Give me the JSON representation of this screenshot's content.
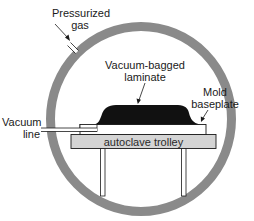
{
  "diagram": {
    "type": "autoclave-cross-section",
    "labels": {
      "pressurized_gas_line1": "Pressurized",
      "pressurized_gas_line2": "gas",
      "laminate_line1": "Vacuum-bagged",
      "laminate_line2": "laminate",
      "baseplate_line1": "Mold",
      "baseplate_line2": "baseplate",
      "vacuum_line_line1": "Vacuum",
      "vacuum_line_line2": "line",
      "trolley": "autoclave trolley"
    },
    "colors": {
      "vessel_wall": "#8a8a8a",
      "laminate": "#111111",
      "trolley_fill": "#d4d4d4",
      "outline": "#1a1a1a",
      "background": "#ffffff"
    }
  }
}
